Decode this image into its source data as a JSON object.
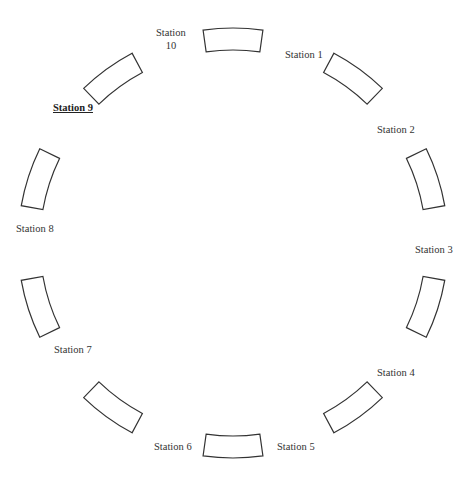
{
  "diagram": {
    "type": "circular-station-layout",
    "center": [
      233,
      243
    ],
    "inner_radius": 193,
    "outer_radius": 215,
    "segment_half_angle_deg": 8,
    "stroke_color": "#333333"
  },
  "stations": [
    {
      "id": 10,
      "label": "Station",
      "label2": "10",
      "angle": 0,
      "lx": 156,
      "ly": 26,
      "highlight": false
    },
    {
      "id": 1,
      "label": "Station 1",
      "angle": 36,
      "lx": 285,
      "ly": 48,
      "highlight": false
    },
    {
      "id": 2,
      "label": "Station 2",
      "angle": 72,
      "lx": 377,
      "ly": 123,
      "highlight": false
    },
    {
      "id": 3,
      "label": "Station 3",
      "angle": 108,
      "lx": 415,
      "ly": 243,
      "highlight": false
    },
    {
      "id": 4,
      "label": "Station 4",
      "angle": 144,
      "lx": 377,
      "ly": 366,
      "highlight": false
    },
    {
      "id": 5,
      "label": "Station 5",
      "angle": 180,
      "lx": 277,
      "ly": 440,
      "highlight": false
    },
    {
      "id": 6,
      "label": "Station 6",
      "angle": 216,
      "lx": 154,
      "ly": 440,
      "highlight": false
    },
    {
      "id": 7,
      "label": "Station 7",
      "angle": 252,
      "lx": 54,
      "ly": 343,
      "highlight": false
    },
    {
      "id": 8,
      "label": "Station 8",
      "angle": 288,
      "lx": 16,
      "ly": 222,
      "highlight": false
    },
    {
      "id": 9,
      "label": "Station 9",
      "angle": 324,
      "lx": 53,
      "ly": 101,
      "highlight": true
    }
  ]
}
